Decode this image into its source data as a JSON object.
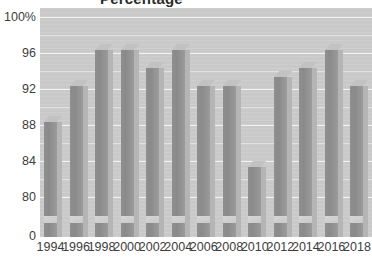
{
  "chart_data": {
    "type": "bar",
    "title": "",
    "xlabel": "",
    "ylabel": "",
    "categories": [
      "1994",
      "1996",
      "1998",
      "2000",
      "2002",
      "2004",
      "2006",
      "2008",
      "2010",
      "2012",
      "2014",
      "2016",
      "2018"
    ],
    "values": [
      89,
      93,
      97,
      97,
      95,
      97,
      93,
      93,
      84,
      94,
      95,
      97,
      93
    ],
    "ytick_labels": [
      "100%",
      "96",
      "92",
      "88",
      "84",
      "80",
      "0"
    ],
    "ytick_values": [
      100,
      96,
      92,
      88,
      84,
      80,
      0
    ],
    "ylim": [
      78,
      100
    ],
    "grid": true,
    "legend": false,
    "axis_break": true,
    "series_name": "",
    "bar_color": "#8f8f8f",
    "plot_background": "#c9c9c9",
    "gridline_color": "#f3f3f3"
  },
  "axes": {
    "y_labels": [
      {
        "text": "100%",
        "value": 100
      },
      {
        "text": "96",
        "value": 96
      },
      {
        "text": "92",
        "value": 92
      },
      {
        "text": "88",
        "value": 88
      },
      {
        "text": "84",
        "value": 84
      },
      {
        "text": "80",
        "value": 80
      },
      {
        "text": "0",
        "value": 0
      }
    ],
    "x_labels": [
      "1994",
      "1996",
      "1998",
      "2000",
      "2002",
      "2004",
      "2006",
      "2008",
      "2010",
      "2012",
      "2014",
      "2016",
      "2018"
    ]
  },
  "title_fragment": {
    "text": "Percentage"
  }
}
